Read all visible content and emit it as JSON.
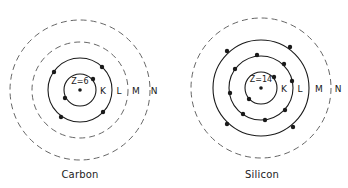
{
  "atoms": [
    {
      "name": "Carbon",
      "nucleus_label": "Z=6",
      "center": [
        80,
        90
      ],
      "shells": [
        {
          "label": "K",
          "r": 16,
          "style": "solid",
          "electrons": [
            [
              93,
              79
            ],
            [
              65,
              98
            ]
          ]
        },
        {
          "label": "L",
          "r": 32,
          "style": "solid",
          "electrons": [
            [
              102,
              67
            ],
            [
              54,
              72
            ],
            [
              103,
              112
            ],
            [
              61,
              117
            ]
          ]
        },
        {
          "label": "M",
          "r": 48,
          "style": "dashed",
          "electrons": []
        },
        {
          "label": "N",
          "r": 70,
          "style": "dashed",
          "electrons": []
        }
      ],
      "shell_label_x": [
        103,
        119,
        136,
        154
      ],
      "caption_pos": [
        80,
        176
      ]
    },
    {
      "name": "Silicon",
      "nucleus_label": "Z=14",
      "center": [
        261,
        88
      ],
      "shells": [
        {
          "label": "K",
          "r": 16,
          "style": "solid",
          "electrons": [
            [
              274,
              77
            ],
            [
              249,
              99
            ]
          ]
        },
        {
          "label": "L",
          "r": 32,
          "style": "solid",
          "electrons": [
            [
              257,
              55
            ],
            [
              284,
              64
            ],
            [
              292,
              81
            ],
            [
              235,
              69
            ],
            [
              230,
              93
            ],
            [
              243,
              114
            ],
            [
              265,
              120
            ],
            [
              285,
              110
            ]
          ]
        },
        {
          "label": "M",
          "r": 48,
          "style": "solid",
          "electrons": [
            [
              227,
              51
            ],
            [
              290,
              47
            ],
            [
              227,
              124
            ],
            [
              293,
              127
            ]
          ]
        },
        {
          "label": "N",
          "r": 70,
          "style": "dashed",
          "electrons": []
        }
      ],
      "shell_label_x": [
        284,
        300,
        319,
        338
      ],
      "caption_pos": [
        262,
        176
      ]
    }
  ],
  "colors": {
    "ink": "#1a1a1a",
    "dashed": "#555555"
  }
}
